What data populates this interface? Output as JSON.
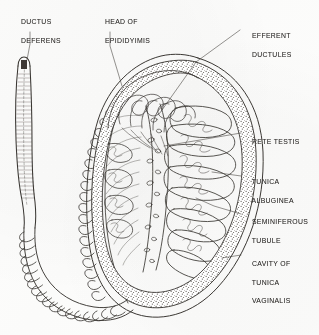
{
  "figure": {
    "background_color": "#fdfdfc",
    "ink_color": "#3a3733",
    "style": "hand-drawn pen-and-ink anatomical line drawing with stippling"
  },
  "labels": [
    {
      "id": "ductus-deferens",
      "line1": "DUCTUS",
      "line2": "DEFERENS",
      "x": 12,
      "y": 8,
      "leader": "from label down-right to cut end of the vas deferens tube"
    },
    {
      "id": "head-of-epididymis",
      "line1": "HEAD OF",
      "line2": "EPIDIDYIMIS",
      "x": 96,
      "y": 8,
      "leader": "from label down-left to upper convoluted epididymal head"
    },
    {
      "id": "efferent-ductules",
      "line1": "EFFERENT",
      "line2": "DUCTULES",
      "x": 243,
      "y": 22,
      "leader": "from label down-left into the looping ductules at testis apex"
    },
    {
      "id": "rete-testis",
      "line1": "RETE TESTIS",
      "line2": "",
      "x": 243,
      "y": 128,
      "leader": "from label left to the mediastinum channel network"
    },
    {
      "id": "tunica-albuginea",
      "line1": "TUNICA",
      "line2": "ALBUGINEA",
      "x": 243,
      "y": 168,
      "leader": "from label left to the stippled fibrous capsule"
    },
    {
      "id": "seminiferous-tubule",
      "line1": "SEMINIFEROUS",
      "line2": "TUBULE",
      "x": 243,
      "y": 208,
      "leader": "from label left to a coiled tubule inside a lobule"
    },
    {
      "id": "cavity-of-tunica-vaginalis",
      "line1": "CAVITY OF",
      "line2": "TUNICA",
      "line3": "VAGINALIS",
      "x": 243,
      "y": 250,
      "leader": "from label left to the clear serous space outside the capsule"
    }
  ],
  "structures": [
    {
      "id": "vas-deferens-tube",
      "description": "long vertical tube with horizontal muscular hatching and a dark cut lumen at top"
    },
    {
      "id": "epididymis-coil",
      "description": "tightly coiled duct forming a U that wraps the left and lower testis"
    },
    {
      "id": "testis-body",
      "description": "large ovoid organ occupying the centre-right of the plate"
    },
    {
      "id": "tunica-albuginea-capsule",
      "description": "stippled dense capsule surrounding the testis"
    },
    {
      "id": "tunica-vaginalis-cavity",
      "description": "narrow clear serous space between capsule and outer membrane"
    },
    {
      "id": "mediastinum-testis",
      "description": "wedge of connective tissue carrying the rete testis channels"
    },
    {
      "id": "lobules",
      "description": "radiating wedge compartments each holding coiled seminiferous tubules"
    },
    {
      "id": "septa",
      "description": "fine fibrous partitions fanning from the mediastinum to the capsule"
    }
  ]
}
